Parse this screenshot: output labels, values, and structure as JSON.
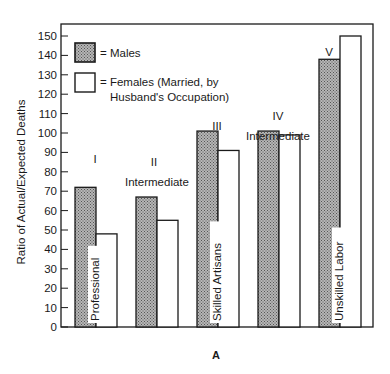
{
  "chart_data": {
    "type": "bar",
    "title": "",
    "panel_label": "A",
    "xlabel": "",
    "ylabel": "Ratio of Actual/Expected Deaths",
    "ylim": [
      0,
      150
    ],
    "yticks": [
      0,
      10,
      20,
      30,
      40,
      50,
      60,
      70,
      80,
      90,
      100,
      110,
      120,
      130,
      140,
      150
    ],
    "grid": false,
    "legend_position": "upper-left-inside",
    "categories": [
      "I",
      "II",
      "III",
      "IV",
      "V"
    ],
    "category_sublabels": [
      "",
      "Intermediate",
      "",
      "Intermediate",
      ""
    ],
    "bar_inner_labels": [
      "Professional",
      "",
      "Skilled Artisans",
      "",
      "Unskilled Labor"
    ],
    "series": [
      {
        "name": "Males",
        "legend_text": "= Males",
        "fill": "#9a9a9a",
        "pattern": "stippled",
        "values": [
          72,
          67,
          101,
          101,
          138
        ]
      },
      {
        "name": "Females (Married, by Husband's Occupation)",
        "legend_text_lines": [
          "= Females (Married, by",
          "Husband's Occupation)"
        ],
        "fill": "#ffffff",
        "values": [
          48,
          55,
          91,
          99,
          150
        ]
      }
    ]
  },
  "colors": {
    "axis": "#1a1a1a",
    "male_fill": "#9a9a9a",
    "female_fill": "#ffffff"
  }
}
